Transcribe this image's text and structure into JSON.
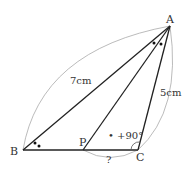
{
  "diagram": {
    "points": {
      "A": {
        "label": "A",
        "x": 170,
        "y": 26
      },
      "B": {
        "label": "B",
        "x": 23,
        "y": 150
      },
      "P": {
        "label": "P",
        "x": 83,
        "y": 150
      },
      "C": {
        "label": "C",
        "x": 138,
        "y": 150
      }
    },
    "labels": {
      "AB": "7cm",
      "AC": "5cm",
      "PC": "?",
      "angle_C": "• +90°"
    },
    "colors": {
      "line": "#222222",
      "arc": "#aaaaaa",
      "text": "#333333"
    }
  }
}
